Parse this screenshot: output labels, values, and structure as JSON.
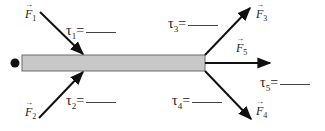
{
  "diagram": {
    "title": "",
    "pivot": {
      "label": "",
      "color": "#111111"
    },
    "rod": {
      "fill": "#c8c8c8",
      "stroke": "#6a6a6a"
    },
    "forces": [
      {
        "id": "F1",
        "symbol": "F",
        "subscript": "1"
      },
      {
        "id": "F2",
        "symbol": "F",
        "subscript": "2"
      },
      {
        "id": "F3",
        "symbol": "F",
        "subscript": "3"
      },
      {
        "id": "F4",
        "symbol": "F",
        "subscript": "4"
      },
      {
        "id": "F5",
        "symbol": "F",
        "subscript": "5"
      }
    ],
    "torques": [
      {
        "id": "tau1",
        "symbol": "τ",
        "subscript": "1",
        "equals": "=",
        "answer": ""
      },
      {
        "id": "tau2",
        "symbol": "τ",
        "subscript": "2",
        "equals": "=",
        "answer": ""
      },
      {
        "id": "tau3",
        "symbol": "τ",
        "subscript": "3",
        "equals": "=",
        "answer": ""
      },
      {
        "id": "tau4",
        "symbol": "τ",
        "subscript": "4",
        "equals": "=",
        "answer": ""
      },
      {
        "id": "tau5",
        "symbol": "τ",
        "subscript": "5",
        "equals": "=",
        "answer": ""
      }
    ]
  }
}
